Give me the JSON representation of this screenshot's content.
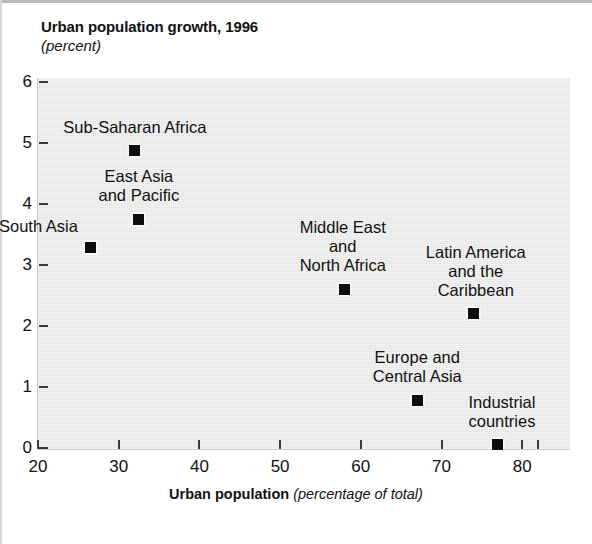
{
  "title": "Urban population growth, 1996",
  "subtitle": "(percent)",
  "x_axis_title_bold": "Urban population",
  "x_axis_title_italic": "(percentage of total)",
  "y_tick_labels": [
    "0",
    "1",
    "2",
    "3",
    "4",
    "5",
    "6"
  ],
  "x_tick_labels": [
    "20",
    "30",
    "40",
    "50",
    "60",
    "70",
    "80"
  ],
  "colors": {
    "marker": "#0d0d0d",
    "plot_background": "#e3e3e3",
    "text": "#111111"
  },
  "chart_data": {
    "type": "scatter",
    "title": "Urban population growth, 1996 (percent)",
    "xlabel": "Urban population (percentage of total)",
    "ylabel": "Urban population growth, 1996 (percent)",
    "xlim": [
      20,
      82
    ],
    "ylim": [
      0,
      6
    ],
    "xticks": [
      20,
      30,
      40,
      50,
      60,
      70,
      80
    ],
    "yticks": [
      0,
      1,
      2,
      3,
      4,
      5,
      6
    ],
    "grid": false,
    "legend": "none (points labeled directly)",
    "points": [
      {
        "label": "Sub-Saharan Africa",
        "label_lines": [
          "Sub-Saharan Africa"
        ],
        "x": 32.0,
        "y": 4.87,
        "label_position": "above"
      },
      {
        "label": "East Asia and Pacific",
        "label_lines": [
          "East Asia",
          "and Pacific"
        ],
        "x": 32.5,
        "y": 3.75,
        "label_position": "above"
      },
      {
        "label": "South Asia",
        "label_lines": [
          "South Asia"
        ],
        "x": 26.5,
        "y": 3.28,
        "label_position": "above-left"
      },
      {
        "label": "Middle East and North Africa",
        "label_lines": [
          "Middle East",
          "and",
          "North Africa"
        ],
        "x": 58.0,
        "y": 2.6,
        "label_position": "above"
      },
      {
        "label": "Latin America and the Caribbean",
        "label_lines": [
          "Latin America",
          "and the",
          "Caribbean"
        ],
        "x": 74.0,
        "y": 2.2,
        "label_position": "above"
      },
      {
        "label": "Europe and Central Asia",
        "label_lines": [
          "Europe and",
          "Central Asia"
        ],
        "x": 67.0,
        "y": 0.78,
        "label_position": "above"
      },
      {
        "label": "Industrial countries",
        "label_lines": [
          "Industrial",
          "countries"
        ],
        "x": 77.0,
        "y": 0.05,
        "label_position": "above"
      }
    ]
  }
}
